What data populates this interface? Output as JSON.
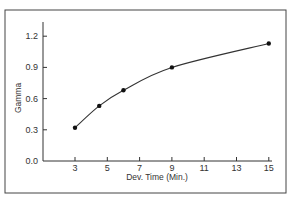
{
  "chart_data": {
    "type": "line",
    "title": "",
    "xlabel": "Dev. Time (Min.)",
    "ylabel": "Gamma",
    "x_ticks": [
      "3",
      "5",
      "7",
      "9",
      "11",
      "13",
      "15"
    ],
    "y_ticks": [
      "0.0",
      "0.3",
      "0.6",
      "0.9",
      "1.2"
    ],
    "xlim": [
      1.5,
      15
    ],
    "ylim": [
      0.0,
      1.2
    ],
    "grid": false,
    "legend": null,
    "series": [
      {
        "name": "Gamma vs Dev. Time",
        "x": [
          3,
          4.5,
          6,
          9,
          15
        ],
        "y": [
          0.32,
          0.53,
          0.68,
          0.9,
          1.13
        ],
        "markers": true,
        "smooth": true
      }
    ]
  },
  "colors": {
    "line": "#333333",
    "axis": "#333333",
    "frame": "#444444",
    "background": "#ffffff"
  }
}
